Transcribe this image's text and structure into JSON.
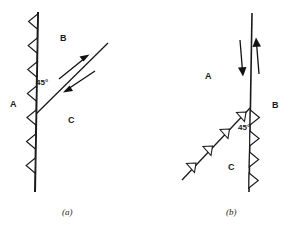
{
  "figure": {
    "type": "geological-fault-diagram",
    "width": 298,
    "height": 234,
    "background_color": "#ffffff",
    "line_color": "#1a1a1a",
    "panels": [
      {
        "id": "a",
        "caption": "(a)",
        "caption_x": 62,
        "caption_y": 208,
        "description": "Vertical thrust fault with hanging-wall teeth pointing left and an oblique fault plane dipping 45 degrees with antiparallel shear arrows",
        "blocks": [
          {
            "label": "A",
            "x": 10,
            "y": 100
          },
          {
            "label": "B",
            "x": 60,
            "y": 34
          },
          {
            "label": "C",
            "x": 68,
            "y": 116
          }
        ],
        "angle_label": {
          "text": "45°",
          "x": 36,
          "y": 79
        },
        "main_fault": {
          "name": "vertical-fault-a",
          "x1": 38,
          "y1": 12,
          "x2": 35,
          "y2": 192,
          "stroke_width": 2.0,
          "teeth_count": 7,
          "teeth_direction": "left",
          "teeth_size": 9
        },
        "secondary_fault": {
          "name": "oblique-fault-a",
          "x1": 36,
          "y1": 114,
          "x2": 108,
          "y2": 43,
          "stroke_width": 1.3,
          "dip": "45°"
        },
        "shear_arrows": [
          {
            "name": "arrow-up-right",
            "x1": 59,
            "y1": 78,
            "x2": 88,
            "y2": 56,
            "head": "end"
          },
          {
            "name": "arrow-down-left",
            "x1": 94,
            "y1": 72,
            "x2": 64,
            "y2": 92,
            "head": "end"
          }
        ]
      },
      {
        "id": "b",
        "caption": "(b)",
        "caption_x": 226,
        "caption_y": 208,
        "description": "Vertical fault with teeth pointing right, intersected by a 45 degree oblique thrust fault carrying teeth, and a pair of antiparallel vertical dip-slip arrows",
        "blocks": [
          {
            "label": "A",
            "x": 205,
            "y": 72
          },
          {
            "label": "B",
            "x": 272,
            "y": 101
          },
          {
            "label": "C",
            "x": 228,
            "y": 163
          }
        ],
        "angle_label": {
          "text": "45°",
          "x": 238,
          "y": 124
        },
        "main_fault": {
          "name": "vertical-fault-b",
          "x1": 252,
          "y1": 13,
          "x2": 249,
          "y2": 192,
          "stroke_width": 1.6,
          "teeth_count": 4,
          "teeth_direction": "right",
          "teeth_size": 9,
          "teeth_start_y": 108
        },
        "secondary_fault": {
          "name": "oblique-fault-b",
          "x1": 250,
          "y1": 108,
          "x2": 182,
          "y2": 180,
          "stroke_width": 1.3,
          "dip": "45°",
          "teeth_count": 4,
          "teeth_direction": "upper-left",
          "teeth_size": 9
        },
        "dip_slip_arrows": [
          {
            "name": "arrow-down",
            "x1": 240,
            "y1": 40,
            "x2": 243,
            "y2": 74,
            "head": "end",
            "direction": "down"
          },
          {
            "name": "arrow-up",
            "x1": 259,
            "y1": 74,
            "x2": 256,
            "y2": 40,
            "head": "end",
            "direction": "up"
          }
        ]
      }
    ]
  }
}
